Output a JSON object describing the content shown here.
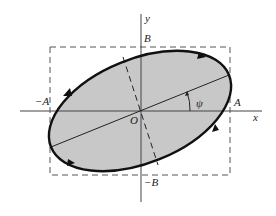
{
  "figure": {
    "type": "polarization-ellipse",
    "colors": {
      "fill": "#c8c8c8",
      "stroke": "#111111",
      "axis": "#444444",
      "dashed": "#555555",
      "background": "#ffffff"
    },
    "labels": {
      "y_axis": "y",
      "x_axis": "x",
      "top": "B",
      "bottom": "−B",
      "left": "−A",
      "right": "A",
      "origin": "O",
      "angle": "ψ"
    },
    "bounding_box": {
      "half_width_label": "A",
      "half_height_label": "B"
    },
    "ellipse": {
      "tilt_angle_label": "ψ",
      "direction": "clockwise",
      "arrow_count": 4
    }
  }
}
